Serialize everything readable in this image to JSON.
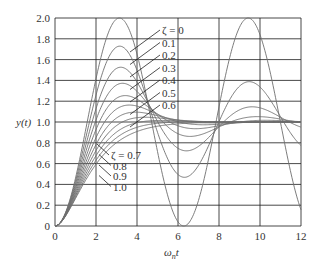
{
  "chart_data": {
    "type": "line",
    "title": "",
    "xlabel": "ωnt",
    "ylabel": "y(t)",
    "xlim": [
      0,
      12
    ],
    "ylim": [
      0,
      2.0
    ],
    "grid": true,
    "x_ticks": [
      "0",
      "2",
      "4",
      "6",
      "8",
      "10",
      "12"
    ],
    "y_ticks": [
      "0",
      "0.2",
      "0.4",
      "0.6",
      "0.8",
      "1.0",
      "1.2",
      "1.4",
      "1.6",
      "1.8",
      "2.0"
    ],
    "series": [
      {
        "name": "ζ = 0",
        "zeta": 0.0
      },
      {
        "name": "0.1",
        "zeta": 0.1
      },
      {
        "name": "0.2",
        "zeta": 0.2
      },
      {
        "name": "0.3",
        "zeta": 0.3
      },
      {
        "name": "0.4",
        "zeta": 0.4
      },
      {
        "name": "0.5",
        "zeta": 0.5
      },
      {
        "name": "0.6",
        "zeta": 0.6
      },
      {
        "name": "ζ = 0.7",
        "zeta": 0.7
      },
      {
        "name": "0.8",
        "zeta": 0.8
      },
      {
        "name": "0.9",
        "zeta": 0.9
      },
      {
        "name": "1.0",
        "zeta": 1.0
      }
    ],
    "annotations": {
      "upper_labels": [
        "ζ = 0",
        "0.1",
        "0.2",
        "0.3",
        "0.4",
        "0.5",
        "0.6"
      ],
      "lower_labels": [
        "ζ = 0.7",
        "0.8",
        "0.9",
        "1.0"
      ]
    }
  },
  "layout": {
    "plot_left": 55,
    "plot_right": 301,
    "plot_top": 18,
    "plot_bottom": 226,
    "curve_color": "#6e6e6e",
    "grid_color": "#1a1a1a"
  }
}
